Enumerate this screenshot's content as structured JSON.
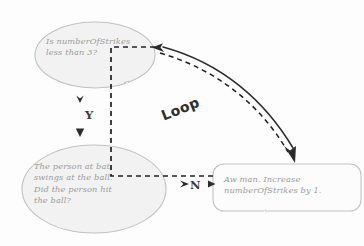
{
  "diagram": {
    "style": "hand-drawn whiteboard sketch",
    "colors": {
      "background": "#fdfdfd",
      "shape_fill": "#f2f2f2",
      "shape_stroke": "#c0c0c0",
      "node_text": "#9a9a9a",
      "connector_solid": "#2b2b2b",
      "connector_dashed": "#1f1f1f",
      "label_text": "#3a3a3a"
    },
    "nodes": [
      {
        "id": "decision",
        "shape": "ellipse",
        "lines": [
          "Is numberOfStrikes",
          "less than 3?"
        ],
        "text": "Is numberOfStrikes\nless than 3?"
      },
      {
        "id": "action",
        "shape": "ellipse",
        "lines": [
          "The person at bat",
          "swings at the ball.",
          "Did the person hit",
          "the ball?"
        ],
        "text": "The person at bat\nswings at the ball.\nDid the person hit\nthe ball?"
      },
      {
        "id": "process",
        "shape": "rounded-rectangle",
        "lines": [
          "Aw man. Increase",
          "numberOfStrikes by 1."
        ],
        "text": "Aw man. Increase\nnumberOfStrikes by 1."
      }
    ],
    "labels": {
      "yes_branch": "Y",
      "no_branch": "N",
      "loop_annotation": "Loop"
    },
    "edges": [
      {
        "id": "decision-to-action",
        "from": "decision",
        "to": "action",
        "label": "Y",
        "style": "dashed-with-arrowheads"
      },
      {
        "id": "action-to-process",
        "from": "action",
        "to": "process",
        "label": "N",
        "style": "dashed-with-arrowheads"
      },
      {
        "id": "process-to-decision",
        "from": "process",
        "to": "decision",
        "label": "Loop",
        "style": "solid-curved-arrow"
      },
      {
        "id": "decision-to-process-curve",
        "from": "decision",
        "to": "process",
        "label": "",
        "style": "dashed-curved-arrow"
      }
    ]
  }
}
